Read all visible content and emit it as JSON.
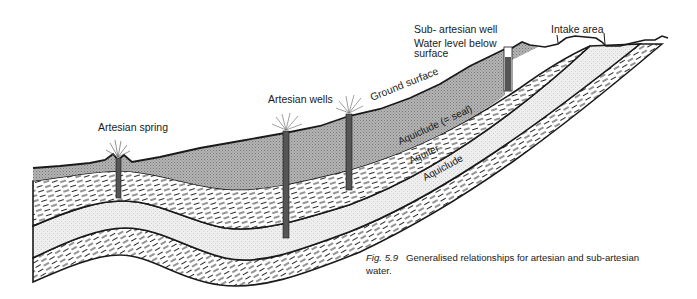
{
  "figure": {
    "caption_number": "Fig. 5.9",
    "caption_text": "Generalised relationships for artesian and sub-artesian water."
  },
  "labels": {
    "artesian_spring": "Artesian spring",
    "artesian_wells": "Artesian wells",
    "ground_surface": "Ground surface",
    "sub_artesian_well": "Sub- artesian well",
    "water_level_line1": "Water level below",
    "water_level_line2": "surface",
    "intake_area": "Intake area",
    "upper_aquiclude": "Aquiclude (= seal)",
    "aquifer": "Aquifer",
    "lower_aquiclude": "Aquiclude"
  },
  "layers": [
    {
      "name": "Overburden",
      "pattern": "stippled-grey"
    },
    {
      "name": "Aquiclude (= seal)",
      "pattern": "dashed-shale"
    },
    {
      "name": "Aquifer",
      "pattern": "fine-stipple"
    },
    {
      "name": "Aquiclude",
      "pattern": "dashed-shale"
    }
  ],
  "colors": {
    "overburden": "#a9a9a9",
    "aquifer": "#ececec",
    "aquiclude": "#ffffff",
    "well_casing": "#555555",
    "line": "#1a1a1a"
  }
}
